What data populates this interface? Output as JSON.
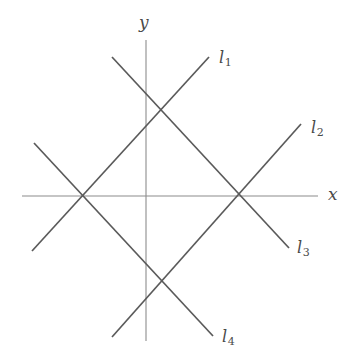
{
  "figure": {
    "type": "geometry-diagram",
    "background_color": "#ffffff",
    "axis_color": "#8c8c8c",
    "line_color": "#5a5a5a",
    "canvas": {
      "width": 354,
      "height": 360
    }
  },
  "axes": {
    "x_axis": {
      "label": "x",
      "label_x": 328,
      "label_y": 186,
      "x1": 22,
      "y1": 196,
      "x2": 318,
      "y2": 196
    },
    "y_axis": {
      "label": "y",
      "label_x": 139,
      "label_y": 14,
      "x1": 146,
      "y1": 40,
      "x2": 146,
      "y2": 341
    },
    "origin": {
      "x": 146,
      "y": 196
    }
  },
  "lines": [
    {
      "id": "l1",
      "label": "l",
      "subscript": "1",
      "slope_sign": "positive",
      "x1": 32,
      "y1": 251,
      "x2": 209,
      "y2": 57,
      "label_x": 219,
      "label_y": 50
    },
    {
      "id": "l2",
      "label": "l",
      "subscript": "2",
      "slope_sign": "positive",
      "x1": 112,
      "y1": 337,
      "x2": 301,
      "y2": 124,
      "label_x": 311,
      "label_y": 120
    },
    {
      "id": "l3",
      "label": "l",
      "subscript": "3",
      "slope_sign": "negative",
      "x1": 112,
      "y1": 57,
      "x2": 289,
      "y2": 248,
      "label_x": 297,
      "label_y": 240
    },
    {
      "id": "l4",
      "label": "l",
      "subscript": "4",
      "slope_sign": "negative",
      "x1": 34,
      "y1": 143,
      "x2": 213,
      "y2": 336,
      "label_x": 222,
      "label_y": 329
    }
  ],
  "intersections": [
    {
      "name": "left-vertex",
      "x": 80,
      "y": 196,
      "on_axis": "x"
    },
    {
      "name": "top-vertex",
      "x": 160,
      "y": 110,
      "on_axis": "none"
    },
    {
      "name": "right-vertex",
      "x": 240,
      "y": 196,
      "on_axis": "x"
    },
    {
      "name": "bottom-vertex",
      "x": 160,
      "y": 282,
      "on_axis": "none"
    }
  ]
}
